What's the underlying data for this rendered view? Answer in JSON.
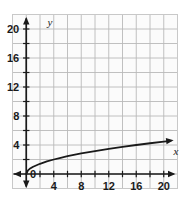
{
  "figure": {
    "kind": "coordinate-plane-graph",
    "background_color": "#ffffff",
    "plot_background_color": "#fbfbfb",
    "frame_color": "#c8c8c8",
    "grid_color": "#b9b9b9",
    "axis_color": "#1a1a1a",
    "curve_color": "#1a1a1a",
    "x_axis_title": "x",
    "y_axis_title": "y",
    "origin_label": "0"
  },
  "chart_data": {
    "type": "line",
    "title": "",
    "subtitle": "",
    "xlabel": "x",
    "ylabel": "y",
    "xlim": [
      -2,
      22
    ],
    "ylim": [
      -2,
      22
    ],
    "grid": true,
    "grid_step": 2,
    "legend": "none",
    "x_tick_labels": [
      "0",
      "4",
      "8",
      "12",
      "16",
      "20"
    ],
    "x_tick_values": [
      0,
      4,
      8,
      12,
      16,
      20
    ],
    "y_tick_labels": [
      "4",
      "8",
      "12",
      "16",
      "20"
    ],
    "y_tick_values": [
      4,
      8,
      12,
      16,
      20
    ],
    "minor_tick_step": 2,
    "annotations": [
      "x-axis arrowhead at right end",
      "y-axis arrowheads at top and bottom",
      "curve arrowhead at right end"
    ],
    "series": [
      {
        "name": "y = sqrt(x)",
        "equation": "y = √x",
        "arrow_end": true,
        "x": [
          0,
          0.25,
          0.5,
          1,
          2,
          3,
          4,
          5,
          6,
          8,
          10,
          12,
          14,
          16,
          18,
          20,
          21
        ],
        "values": [
          0,
          0.5,
          0.71,
          1,
          1.41,
          1.73,
          2,
          2.24,
          2.45,
          2.83,
          3.16,
          3.46,
          3.74,
          4,
          4.24,
          4.47,
          4.58
        ]
      }
    ]
  }
}
